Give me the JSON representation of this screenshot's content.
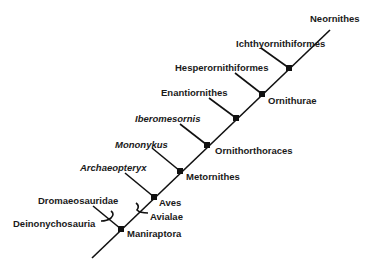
{
  "diagram": {
    "type": "cladogram",
    "taxa": {
      "neornithes": "Neornithes",
      "ichthyornithiformes": "Ichthyornithiformes",
      "hesperornithiformes": "Hesperornithiformes",
      "enantiornithes": "Enantiornithes",
      "iberomesornis": "Iberomesornis",
      "mononykus": "Mononykus",
      "archaeopteryx": "Archaeopteryx",
      "dromaeosauridae": "Dromaeosauridae"
    },
    "clades": {
      "ornithurae": "Ornithurae",
      "ornithorthoraces": "Ornithorthoraces",
      "metornithes": "Metornithes",
      "aves": "Aves",
      "avialae": "Avialae",
      "deinonychosauria": "Deinonychosauria",
      "maniraptora": "Maniraptora"
    },
    "colors": {
      "line": "#111111",
      "text": "#1a1a1a",
      "background": "#ffffff"
    }
  }
}
